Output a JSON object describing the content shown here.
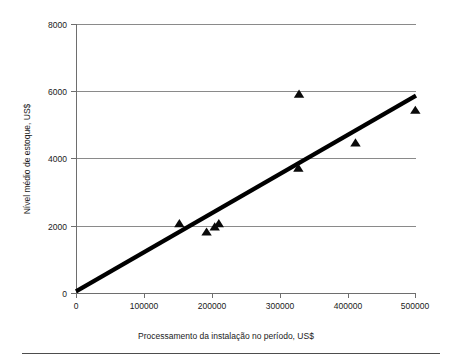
{
  "chart_data": {
    "type": "scatter",
    "title": "",
    "subtitle": "",
    "xlabel": "Processamento da instalação no período, US$",
    "ylabel": "Nível médio de estoque, US$",
    "xlim": [
      0,
      500000
    ],
    "ylim": [
      0,
      8000
    ],
    "grid": true,
    "grid_axis": "y",
    "legend": false,
    "legend_position": "none",
    "marker": "triangle-up",
    "marker_color": "#0a0a0a",
    "xticks": [
      0,
      100000,
      200000,
      300000,
      400000,
      500000
    ],
    "xtick_labels": [
      "0",
      "100000",
      "200000",
      "300000",
      "400000",
      "500000"
    ],
    "yticks": [
      0,
      2000,
      4000,
      6000,
      8000
    ],
    "ytick_labels": [
      "0",
      "2000",
      "4000",
      "6000",
      "8000"
    ],
    "points": [
      {
        "x": 152000,
        "y": 2050
      },
      {
        "x": 192000,
        "y": 1800
      },
      {
        "x": 204000,
        "y": 1950
      },
      {
        "x": 210000,
        "y": 2050
      },
      {
        "x": 328000,
        "y": 5900
      },
      {
        "x": 327000,
        "y": 3700
      },
      {
        "x": 411000,
        "y": 4450
      },
      {
        "x": 499000,
        "y": 5420
      }
    ],
    "series": [
      {
        "name": "Nível médio de estoque",
        "type": "scatter",
        "x": [
          152000,
          192000,
          204000,
          210000,
          328000,
          327000,
          411000,
          499000
        ],
        "values": [
          2050,
          1800,
          1950,
          2050,
          5900,
          3700,
          4450,
          5420
        ]
      },
      {
        "name": "Linha de tendência",
        "type": "line",
        "x": [
          0,
          500000
        ],
        "values": [
          50,
          5870
        ]
      }
    ],
    "trend_line": {
      "x_start": 0,
      "y_start": 50,
      "x_end": 500000,
      "y_end": 5870,
      "color": "#000000"
    },
    "annotations": []
  },
  "colors": {
    "marker": "#0a0a0a",
    "trend": "#000000",
    "grid": "#8a8a8a",
    "axis": "#6e6e6e",
    "text": "#1a1a1a",
    "background": "#ffffff",
    "footer_rule": "#4d4d4d"
  }
}
